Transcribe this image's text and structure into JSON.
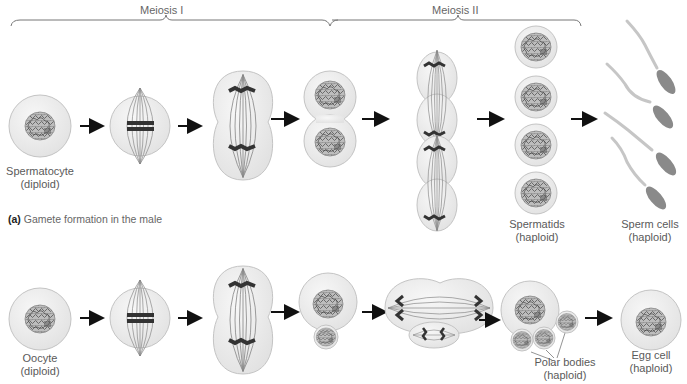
{
  "phases": {
    "meiosis1": "Meiosis I",
    "meiosis2": "Meiosis II"
  },
  "male": {
    "caption_tag": "(a)",
    "caption_text": "Gamete formation in the male",
    "labels": {
      "start": {
        "name": "Spermatocyte",
        "ploidy": "(diploid)"
      },
      "spermatids": {
        "name": "Spermatids",
        "ploidy": "(haploid)"
      },
      "sperm": {
        "name": "Sperm cells",
        "ploidy": "(haploid)"
      }
    },
    "stages": [
      "spermatocyte",
      "metaphase-I",
      "anaphase-I",
      "telophase-I",
      "anaphase-II",
      "spermatids",
      "sperm-cells"
    ]
  },
  "female": {
    "labels": {
      "start": {
        "name": "Oocyte",
        "ploidy": "(diploid)"
      },
      "polar": {
        "name": "Polar bodies",
        "ploidy": "(haploid)"
      },
      "egg": {
        "name": "Egg cell",
        "ploidy": "(haploid)"
      }
    },
    "stages": [
      "oocyte",
      "metaphase-I",
      "anaphase-I",
      "telophase-I",
      "anaphase-II",
      "polar-bodies",
      "egg-cell"
    ]
  },
  "colors": {
    "cell_fill": "#ececec",
    "cell_stroke": "#bdbdbd",
    "chromatin": "#6a6a6a",
    "chromosome": "#333333",
    "arrow": "#111111",
    "text": "#5a5a5a"
  }
}
